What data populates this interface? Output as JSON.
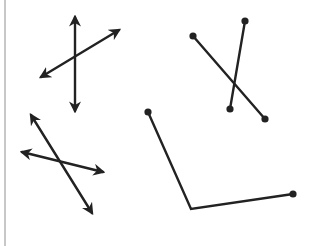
{
  "diagram": {
    "stroke_color": "#222222",
    "border_color": "#c8c8c8",
    "figures": [
      {
        "id": "intersecting-lines-1",
        "type": "lines",
        "lines": [
          {
            "x1": 75,
            "y1": 17,
            "x2": 75,
            "y2": 111,
            "arrows": "both"
          },
          {
            "x1": 41,
            "y1": 77,
            "x2": 119,
            "y2": 30,
            "arrows": "both"
          }
        ]
      },
      {
        "id": "intersecting-segments",
        "type": "segments",
        "lines": [
          {
            "x1": 193,
            "y1": 36,
            "x2": 265,
            "y2": 119,
            "endpoints": "dots"
          },
          {
            "x1": 245,
            "y1": 21,
            "x2": 230,
            "y2": 109,
            "endpoints": "dots"
          }
        ]
      },
      {
        "id": "intersecting-lines-2",
        "type": "lines",
        "lines": [
          {
            "x1": 31,
            "y1": 115,
            "x2": 92,
            "y2": 213,
            "arrows": "both"
          },
          {
            "x1": 22,
            "y1": 152,
            "x2": 103,
            "y2": 172,
            "arrows": "both"
          }
        ]
      },
      {
        "id": "angle",
        "type": "angle",
        "points": [
          {
            "x": 148,
            "y": 112
          },
          {
            "x": 191,
            "y": 209
          },
          {
            "x": 293,
            "y": 194
          }
        ],
        "endpoints": "dots"
      }
    ]
  }
}
